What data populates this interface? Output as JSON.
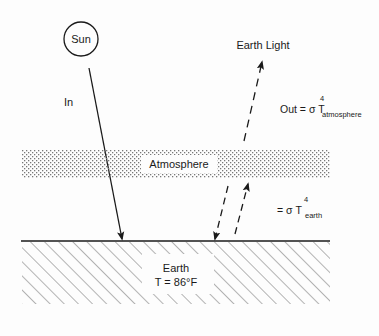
{
  "diagram": {
    "sun": {
      "label": "Sun"
    },
    "incoming": {
      "label": "In"
    },
    "outgoing": {
      "label": "Earth Light"
    },
    "atmosphere": {
      "label": "Atmosphere"
    },
    "out_formula": {
      "prefix": "Out = σ T",
      "exponent": "4",
      "subscript": "atmosphere"
    },
    "earth_formula": {
      "prefix": "= σ T",
      "exponent": "4",
      "subscript": "earth"
    },
    "earth": {
      "label": "Earth",
      "temperature": "T = 86°F"
    },
    "colors": {
      "line": "#1a1a1a",
      "hatch": "#6a6a6a",
      "stipple": "#7a7a7a",
      "background": "#fdfdfd"
    }
  }
}
